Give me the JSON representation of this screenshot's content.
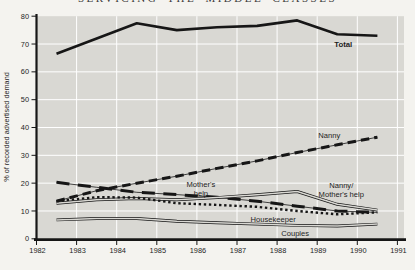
{
  "page_header": {
    "title": "SERVICING THE MIDDLE CLASSES"
  },
  "chart_data": {
    "type": "line",
    "title": "",
    "ylabel": "% of recorded advertised demand",
    "xlim": [
      1982,
      1991
    ],
    "ylim": [
      0,
      80
    ],
    "xticks": [
      1982,
      1983,
      1984,
      1985,
      1986,
      1987,
      1988,
      1989,
      1990,
      1991
    ],
    "yticks": [
      0,
      10,
      20,
      30,
      40,
      50,
      60,
      70,
      80
    ],
    "grid": true,
    "legend_position": "inline-annotations",
    "x": [
      1982.5,
      1983.5,
      1984.5,
      1985.5,
      1986.5,
      1987.5,
      1988.5,
      1989.5,
      1990.5
    ],
    "series": [
      {
        "name": "Total",
        "style": "solid",
        "values": [
          66.5,
          72.0,
          77.5,
          75.0,
          76.0,
          76.5,
          78.5,
          73.5,
          73.0
        ]
      },
      {
        "name": "Nanny",
        "style": "dash",
        "values": [
          13.5,
          17.3,
          20.0,
          22.5,
          25.3,
          28.0,
          31.0,
          33.8,
          36.5
        ]
      },
      {
        "name": "Mother's help",
        "style": "longdash",
        "values": [
          20.3,
          18.5,
          16.7,
          15.9,
          14.9,
          13.5,
          11.7,
          10.0,
          9.5
        ]
      },
      {
        "name": "Nanny/Mother's help",
        "style": "double",
        "values": [
          12.8,
          14.0,
          14.5,
          14.0,
          14.8,
          15.8,
          17.0,
          12.4,
          10.3
        ]
      },
      {
        "name": "Housekeeper",
        "style": "dotted",
        "values": [
          13.5,
          15.0,
          14.8,
          12.8,
          12.2,
          11.5,
          10.0,
          8.8,
          9.5
        ]
      },
      {
        "name": "Couples",
        "style": "double",
        "values": [
          6.8,
          7.3,
          7.3,
          6.3,
          5.8,
          5.3,
          4.8,
          4.6,
          5.3
        ]
      }
    ],
    "annotations": [
      {
        "lines": [
          "Total"
        ],
        "x": 1989.65,
        "y": 69.8,
        "bold": true
      },
      {
        "lines": [
          "Nanny"
        ],
        "x": 1989.3,
        "y": 37.0,
        "bold": false
      },
      {
        "lines": [
          "Mother's",
          "help"
        ],
        "x": 1986.1,
        "y": 18.0,
        "bold": false
      },
      {
        "lines": [
          "Nanny/",
          "Mother's help"
        ],
        "x": 1989.6,
        "y": 17.4,
        "bold": false
      },
      {
        "lines": [
          "Housekeeper"
        ],
        "x": 1987.9,
        "y": 7.1,
        "bold": false
      },
      {
        "lines": [
          "Couples"
        ],
        "x": 1988.45,
        "y": 1.9,
        "bold": false
      }
    ],
    "colors": {
      "line": "#161616",
      "plot_bg": "#d9d8d3",
      "grid": "#ffffff",
      "page_bg": "#f4f3ef",
      "text": "#252525"
    }
  }
}
